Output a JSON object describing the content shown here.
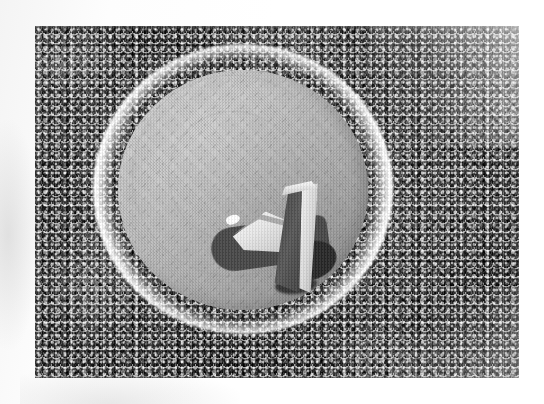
{
  "page": {
    "background_color": "#ffffff",
    "width": 544,
    "height": 404
  },
  "photograph": {
    "kind": "halftone-print-photograph",
    "color_mode": "grayscale",
    "frame": {
      "x": 35,
      "y": 26,
      "width": 484,
      "height": 352
    },
    "scene_description": "Aerial view of an immense dense crowd of people completely filling the frame, surrounding a bright circular open arena at the center, in which a tall angular monument casts a long shadow.",
    "tones": {
      "crowd_dark": "#3d3d3d",
      "crowd_shadow": "#0a0a0a",
      "crowd_highlight": "#fafafa",
      "rim_white": "#ffffff",
      "bowl_light_gray": "#c2c2c2",
      "bowl_mid_gray": "#b6b6b6",
      "bowl_dark_gray": "#9c9c9c",
      "monument_dark_face": "#4e4e4e",
      "monument_light_face": "#e8e8e8",
      "monument_shadow": "#2e2e2e",
      "paper_white": "#ffffff",
      "paper_smudge": "#d2d2d2"
    },
    "elements": {
      "crowd": {
        "name": "crowd",
        "position": "fills entire photo, surrounding the circle on all sides",
        "texture": "dense high-contrast speckle of heads and raised arms"
      },
      "arena_rim": {
        "name": "white rim ring",
        "center": {
          "x": 208,
          "y": 163
        },
        "diameter": 300
      },
      "arena_bowl": {
        "name": "gray circular arena floor",
        "center": {
          "x": 208,
          "y": 164
        },
        "diameter": 250,
        "detail": "smooth gray disc with faint concentric track lines and radial stepped seating visible along the right and upper-right arc"
      },
      "monument": {
        "name": "central monument",
        "description": "tall vertical angular slab with a dark left face and a bright right face, rising from the arena floor, with a lower wing-like white wedge structure to its left",
        "shadow_direction": "cast toward the lower-left"
      }
    }
  }
}
